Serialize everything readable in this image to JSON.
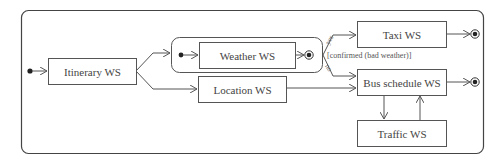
{
  "diagram": {
    "type": "UML activity/state diagram",
    "states": {
      "itinerary": "Itinerary WS",
      "weather": "Weather WS",
      "location": "Location WS",
      "taxi": "Taxi WS",
      "bus": "Bus schedule WS",
      "traffic": "Traffic WS"
    },
    "guards": {
      "yes": "yes",
      "no": "no",
      "condition": "[confirmed (bad weather)]"
    },
    "colors": {
      "line": "#555555",
      "text": "#444444",
      "background": "#ffffff"
    }
  }
}
